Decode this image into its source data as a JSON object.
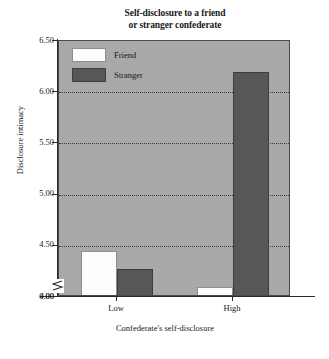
{
  "chart_data": {
    "type": "bar",
    "title": "Self-disclosure to a friend or stranger confederate",
    "title_lines": [
      "Self-disclosure to a friend",
      "or stranger confederate"
    ],
    "xlabel": "Confederate's self-disclosure",
    "ylabel": "Disclosure intimacy",
    "categories": [
      "Low",
      "High"
    ],
    "series": [
      {
        "name": "Friend",
        "values": [
          4.43,
          4.08
        ],
        "color": "#fdfdfd"
      },
      {
        "name": "Stranger",
        "values": [
          4.25,
          6.18
        ],
        "color": "#575757"
      }
    ],
    "ylim": [
      4.0,
      6.5
    ],
    "y_axis_break": true,
    "y_ticks": [
      "6.50",
      "6.00",
      "5.50",
      "5.00",
      "4.50",
      "4.00",
      "0.00"
    ],
    "y_tick_values": [
      6.5,
      6.0,
      5.5,
      5.0,
      4.5,
      4.0,
      0.0
    ],
    "grid": true,
    "gridlines_at": [
      6.0,
      5.5,
      5.0,
      4.5
    ],
    "legend_position": "top-left",
    "plot_background": "#a9a9a9",
    "page_background": "#ffffff",
    "axis_color": "#2b2b2b"
  },
  "legend": {
    "items": [
      {
        "label": "Friend"
      },
      {
        "label": "Stranger"
      }
    ]
  }
}
